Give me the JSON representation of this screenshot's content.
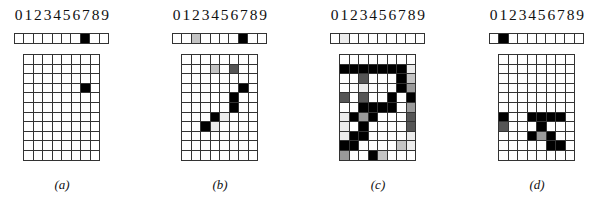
{
  "figure": {
    "digit_labels": [
      "0",
      "1",
      "2",
      "3",
      "4",
      "5",
      "6",
      "7",
      "8",
      "9"
    ],
    "shade_colors": {
      "0": "#ffffff",
      "1": "#ececec",
      "2": "#c4c4c4",
      "3": "#9a9a9a",
      "4": "#555555",
      "5": "#000000"
    },
    "panels": [
      {
        "caption": "(a)",
        "left": 14,
        "strip": [
          0,
          0,
          0,
          0,
          0,
          0,
          0,
          5,
          0,
          0
        ],
        "grid": [
          [
            0,
            0,
            0,
            0,
            0,
            0,
            0,
            0
          ],
          [
            0,
            0,
            0,
            0,
            0,
            0,
            0,
            0
          ],
          [
            0,
            0,
            0,
            0,
            0,
            0,
            0,
            0
          ],
          [
            0,
            0,
            0,
            0,
            0,
            0,
            5,
            0
          ],
          [
            0,
            0,
            0,
            0,
            0,
            0,
            0,
            0
          ],
          [
            0,
            0,
            0,
            0,
            0,
            0,
            0,
            0
          ],
          [
            0,
            0,
            0,
            0,
            0,
            0,
            0,
            0
          ],
          [
            0,
            0,
            0,
            0,
            0,
            0,
            0,
            0
          ],
          [
            0,
            0,
            0,
            0,
            0,
            0,
            0,
            0
          ],
          [
            0,
            0,
            0,
            0,
            0,
            0,
            0,
            0
          ],
          [
            0,
            0,
            0,
            0,
            0,
            0,
            0,
            0
          ]
        ]
      },
      {
        "caption": "(b)",
        "left": 172,
        "strip": [
          0,
          0,
          2,
          0,
          0,
          0,
          0,
          5,
          0,
          0
        ],
        "grid": [
          [
            0,
            0,
            0,
            0,
            0,
            0,
            0,
            0
          ],
          [
            0,
            0,
            0,
            2,
            0,
            4,
            0,
            0
          ],
          [
            0,
            0,
            0,
            0,
            0,
            0,
            0,
            0
          ],
          [
            0,
            0,
            0,
            0,
            0,
            0,
            5,
            0
          ],
          [
            0,
            0,
            0,
            0,
            0,
            5,
            0,
            0
          ],
          [
            0,
            0,
            0,
            0,
            0,
            5,
            0,
            0
          ],
          [
            0,
            0,
            0,
            5,
            1,
            0,
            0,
            0
          ],
          [
            0,
            0,
            5,
            1,
            0,
            0,
            0,
            0
          ],
          [
            0,
            0,
            0,
            0,
            0,
            0,
            0,
            0
          ],
          [
            0,
            0,
            0,
            0,
            0,
            0,
            0,
            0
          ],
          [
            0,
            0,
            0,
            0,
            0,
            0,
            0,
            0
          ]
        ]
      },
      {
        "caption": "(c)",
        "left": 330,
        "strip": [
          0,
          1,
          0,
          0,
          0,
          0,
          0,
          0,
          0,
          0
        ],
        "grid": [
          [
            0,
            0,
            0,
            0,
            0,
            0,
            0,
            0
          ],
          [
            5,
            5,
            5,
            5,
            5,
            5,
            5,
            1
          ],
          [
            0,
            0,
            4,
            0,
            0,
            0,
            5,
            2
          ],
          [
            0,
            0,
            1,
            0,
            0,
            0,
            5,
            3
          ],
          [
            4,
            0,
            4,
            0,
            0,
            5,
            0,
            5
          ],
          [
            0,
            0,
            5,
            5,
            5,
            5,
            0,
            3
          ],
          [
            1,
            5,
            3,
            5,
            0,
            0,
            0,
            4
          ],
          [
            1,
            0,
            5,
            0,
            0,
            0,
            0,
            4
          ],
          [
            1,
            5,
            5,
            0,
            0,
            0,
            0,
            1
          ],
          [
            5,
            5,
            0,
            0,
            0,
            0,
            2,
            1
          ],
          [
            3,
            0,
            0,
            5,
            2,
            0,
            0,
            0
          ]
        ]
      },
      {
        "caption": "(d)",
        "left": 489,
        "strip": [
          0,
          5,
          0,
          0,
          0,
          0,
          0,
          0,
          0,
          0
        ],
        "grid": [
          [
            0,
            0,
            0,
            0,
            0,
            0,
            0,
            0
          ],
          [
            0,
            0,
            0,
            0,
            0,
            0,
            0,
            0
          ],
          [
            0,
            0,
            0,
            0,
            0,
            0,
            0,
            0
          ],
          [
            0,
            0,
            0,
            0,
            0,
            0,
            0,
            0
          ],
          [
            0,
            0,
            0,
            0,
            0,
            0,
            0,
            0
          ],
          [
            0,
            0,
            0,
            0,
            0,
            0,
            0,
            0
          ],
          [
            5,
            0,
            0,
            5,
            5,
            5,
            5,
            0
          ],
          [
            4,
            0,
            0,
            0,
            5,
            0,
            0,
            0
          ],
          [
            0,
            0,
            0,
            5,
            3,
            5,
            0,
            0
          ],
          [
            0,
            0,
            0,
            0,
            0,
            5,
            5,
            0
          ],
          [
            0,
            0,
            0,
            0,
            0,
            0,
            0,
            0
          ]
        ]
      }
    ]
  }
}
